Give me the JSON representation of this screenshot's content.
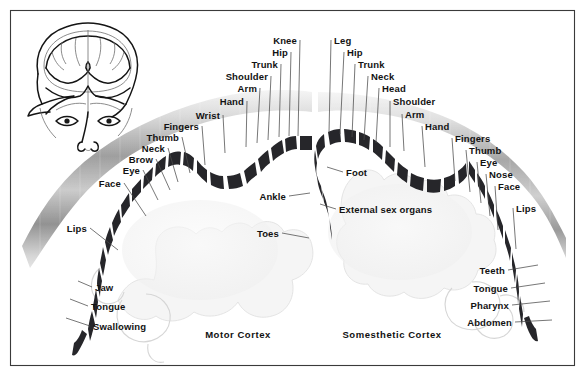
{
  "figure": {
    "width": 585,
    "height": 376,
    "background_color": "#ffffff",
    "frame_color": "#3a3a3a",
    "band_color": "#26262a",
    "label_color": "#121212"
  },
  "inset": {
    "name": "coronal-head-section",
    "description": "Front view of a human head with a coronal brain section exposed"
  },
  "captions": {
    "left": "Motor Cortex",
    "right": "Somesthetic Cortex"
  },
  "motor_cortex": {
    "name": "Motor Cortex",
    "side": "left",
    "labels": [
      {
        "text": "Lips",
        "lx": 90,
        "ly": 228,
        "tx": 118,
        "ty": 250,
        "anchor": "end"
      },
      {
        "text": "Face",
        "lx": 124,
        "ly": 183,
        "tx": 146,
        "ty": 216,
        "anchor": "end"
      },
      {
        "text": "Eye",
        "lx": 143,
        "ly": 170,
        "tx": 158,
        "ty": 200,
        "anchor": "end"
      },
      {
        "text": "Brow",
        "lx": 156,
        "ly": 159,
        "tx": 170,
        "ty": 190,
        "anchor": "end"
      },
      {
        "text": "Neck",
        "lx": 168,
        "ly": 148,
        "tx": 178,
        "ty": 182,
        "anchor": "end"
      },
      {
        "text": "Thumb",
        "lx": 182,
        "ly": 137,
        "tx": 190,
        "ty": 173,
        "anchor": "end"
      },
      {
        "text": "Fingers",
        "lx": 202,
        "ly": 126,
        "tx": 205,
        "ty": 165,
        "anchor": "end"
      },
      {
        "text": "Wrist",
        "lx": 223,
        "ly": 115,
        "tx": 225,
        "ty": 153,
        "anchor": "end"
      },
      {
        "text": "Hand",
        "lx": 247,
        "ly": 101,
        "tx": 246,
        "ty": 147,
        "anchor": "end"
      },
      {
        "text": "Arm",
        "lx": 260,
        "ly": 88,
        "tx": 257,
        "ty": 143,
        "anchor": "end"
      },
      {
        "text": "Shoulder",
        "lx": 271,
        "ly": 76,
        "tx": 268,
        "ty": 140,
        "anchor": "end"
      },
      {
        "text": "Trunk",
        "lx": 281,
        "ly": 64,
        "tx": 279,
        "ty": 137,
        "anchor": "end"
      },
      {
        "text": "Hip",
        "lx": 291,
        "ly": 52,
        "tx": 289,
        "ty": 136,
        "anchor": "end"
      },
      {
        "text": "Knee",
        "lx": 300,
        "ly": 40,
        "tx": 298,
        "ty": 136,
        "anchor": "end"
      },
      {
        "text": "Ankle",
        "lx": 289,
        "ly": 196,
        "tx": 310,
        "ty": 193,
        "anchor": "end"
      },
      {
        "text": "Toes",
        "lx": 282,
        "ly": 233,
        "tx": 309,
        "ty": 238,
        "anchor": "end"
      },
      {
        "text": "Jaw",
        "lx": 92,
        "ly": 287,
        "tx": 78,
        "ty": 281,
        "anchor": "start"
      },
      {
        "text": "Tongue",
        "lx": 88,
        "ly": 306,
        "tx": 70,
        "ty": 299,
        "anchor": "start"
      },
      {
        "text": "Swallowing",
        "lx": 90,
        "ly": 326,
        "tx": 66,
        "ty": 318,
        "anchor": "start"
      }
    ]
  },
  "somesthetic_cortex": {
    "name": "Somesthetic Cortex",
    "side": "right",
    "labels": [
      {
        "text": "Leg",
        "lx": 331,
        "ly": 40,
        "tx": 329,
        "ty": 133,
        "anchor": "start"
      },
      {
        "text": "Hip",
        "lx": 344,
        "ly": 52,
        "tx": 340,
        "ty": 134,
        "anchor": "start"
      },
      {
        "text": "Trunk",
        "lx": 355,
        "ly": 64,
        "tx": 352,
        "ty": 137,
        "anchor": "start"
      },
      {
        "text": "Neck",
        "lx": 368,
        "ly": 76,
        "tx": 364,
        "ty": 140,
        "anchor": "start"
      },
      {
        "text": "Head",
        "lx": 379,
        "ly": 88,
        "tx": 376,
        "ty": 143,
        "anchor": "start"
      },
      {
        "text": "Shoulder",
        "lx": 390,
        "ly": 101,
        "tx": 390,
        "ty": 147,
        "anchor": "start"
      },
      {
        "text": "Arm",
        "lx": 402,
        "ly": 114,
        "tx": 404,
        "ty": 151,
        "anchor": "start"
      },
      {
        "text": "Hand",
        "lx": 422,
        "ly": 126,
        "tx": 425,
        "ty": 167,
        "anchor": "start"
      },
      {
        "text": "Fingers",
        "lx": 452,
        "ly": 138,
        "tx": 455,
        "ty": 181,
        "anchor": "start"
      },
      {
        "text": "Thumb",
        "lx": 466,
        "ly": 150,
        "tx": 470,
        "ty": 192,
        "anchor": "start"
      },
      {
        "text": "Eye",
        "lx": 477,
        "ly": 162,
        "tx": 481,
        "ty": 203,
        "anchor": "start"
      },
      {
        "text": "Nose",
        "lx": 486,
        "ly": 174,
        "tx": 490,
        "ty": 216,
        "anchor": "start"
      },
      {
        "text": "Face",
        "lx": 495,
        "ly": 186,
        "tx": 498,
        "ty": 230,
        "anchor": "start"
      },
      {
        "text": "Lips",
        "lx": 513,
        "ly": 208,
        "tx": 516,
        "ty": 249,
        "anchor": "start"
      },
      {
        "text": "Foot",
        "lx": 343,
        "ly": 172,
        "tx": 327,
        "ty": 167,
        "anchor": "start"
      },
      {
        "text": "External sex organs",
        "lx": 336,
        "ly": 209,
        "tx": 320,
        "ty": 204,
        "anchor": "start"
      },
      {
        "text": "Teeth",
        "lx": 508,
        "ly": 270,
        "tx": 538,
        "ty": 265,
        "anchor": "end"
      },
      {
        "text": "Tongue",
        "lx": 511,
        "ly": 288,
        "tx": 545,
        "ty": 283,
        "anchor": "end"
      },
      {
        "text": "Pharynx",
        "lx": 512,
        "ly": 305,
        "tx": 550,
        "ty": 301,
        "anchor": "end"
      },
      {
        "text": "Abdomen",
        "lx": 515,
        "ly": 322,
        "tx": 552,
        "ty": 320,
        "anchor": "end"
      }
    ]
  }
}
